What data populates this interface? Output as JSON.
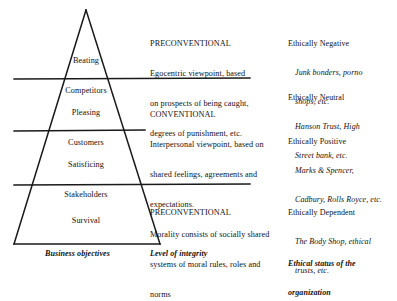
{
  "figure": {
    "line_color": "#1a1a1a"
  },
  "pyramid": {
    "tiers": [
      {
        "id": "beating",
        "lines": [
          "Beating",
          "Competitors"
        ]
      },
      {
        "id": "pleasing",
        "lines": [
          "Pleasing",
          "Customers"
        ]
      },
      {
        "id": "satisficing",
        "lines": [
          "Satisficing",
          "Stakeholders"
        ]
      },
      {
        "id": "survival",
        "lines": [
          "Survival"
        ]
      }
    ]
  },
  "integrity": {
    "blocks": [
      {
        "id": "preconventional-top",
        "heading": "PRECONVENTIONAL",
        "lines": [
          "Egocentric viewpoint, based",
          "on prospects of being caught,",
          "degrees of punishment, etc."
        ]
      },
      {
        "id": "conventional",
        "heading": "CONVENTIONAL",
        "lines": [
          "Interpersonal viewpoint, based on",
          "shared feelings, agreements and",
          "expectations.",
          "Morality consists of socially shared",
          "systems of moral rules, roles and",
          "norms"
        ]
      },
      {
        "id": "preconventional-bottom",
        "heading": "PRECONVENTIONAL",
        "lines": []
      }
    ]
  },
  "ethical_status": {
    "blocks": [
      {
        "id": "negative",
        "heading": "Ethically Negative",
        "examples": [
          "Junk bonders, porno",
          "shops, etc."
        ]
      },
      {
        "id": "neutral",
        "heading": "Ethically Neutral",
        "examples": [
          "Hanson Trust, High",
          "Street bank, etc."
        ]
      },
      {
        "id": "positive",
        "heading": "Ethically Positive",
        "examples": [
          "Marks & Spencer,",
          "Cadbury, Rolls Royce, etc."
        ]
      },
      {
        "id": "dependent",
        "heading": "Ethically Dependent",
        "examples": [
          "The Body Shop, ethical",
          "trusts, etc."
        ]
      }
    ]
  },
  "captions": {
    "business_objectives": "Business objectives",
    "level_of_integrity": "Level of integrity",
    "ethical_status": [
      "Ethical status of the",
      "organization"
    ]
  }
}
